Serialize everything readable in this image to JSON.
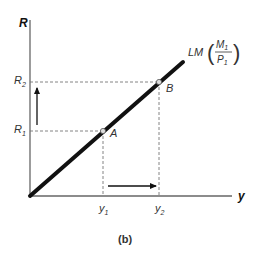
{
  "diagram": {
    "panel_label": "(b)",
    "axes": {
      "y_label": "R",
      "x_label": "y"
    },
    "curve": {
      "name": "LM",
      "fraction_numerator": "M",
      "numerator_sub": "1",
      "fraction_denominator": "P",
      "denominator_sub": "1"
    },
    "points": [
      {
        "label": "A",
        "x_tick": "y",
        "x_sub": "1",
        "y_tick": "R",
        "y_sub": "1"
      },
      {
        "label": "B",
        "x_tick": "y",
        "x_sub": "2",
        "y_tick": "R",
        "y_sub": "2"
      }
    ],
    "arrows": [
      {
        "direction": "up",
        "meaning": "R1 to R2"
      },
      {
        "direction": "right",
        "meaning": "y1 to y2"
      }
    ],
    "colors": {
      "curve": "#111111",
      "axis": "#666666",
      "dashed": "#777777"
    }
  }
}
